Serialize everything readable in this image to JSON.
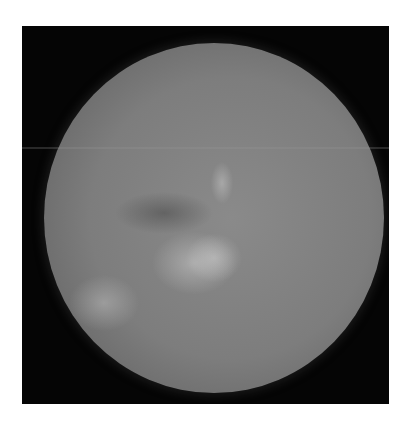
{
  "image": {
    "description": "Circular grayscale endoscopic/fundus-style photograph on a black square frame with a white border",
    "colors": {
      "background": "#ffffff",
      "frame": "#050505",
      "disc_mid": "#7d7d7d",
      "highlight": "#c8c8c8"
    }
  }
}
